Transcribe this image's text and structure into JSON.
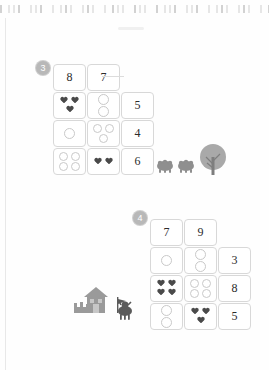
{
  "page": {
    "type": "math-worksheet-scan",
    "background": "#fefefe",
    "ink_color": "#4a4a4a",
    "cell_border_color": "#d8d8d8",
    "badge_color": "#b8b8b8"
  },
  "exercises": [
    {
      "number": "3",
      "header": {
        "left": "8",
        "right": "7"
      },
      "rows": [
        {
          "left": {
            "shape": "heart",
            "count": 3
          },
          "right": {
            "shape": "circle",
            "count": 2
          },
          "answer": "5"
        },
        {
          "left": {
            "shape": "circle",
            "count": 1
          },
          "right": {
            "shape": "circle",
            "count": 3
          },
          "answer": "4"
        },
        {
          "left": {
            "shape": "circle",
            "count": 4
          },
          "right": {
            "shape": "heart",
            "count": 2
          },
          "answer": "6"
        }
      ],
      "illustration": "hedgehogs-and-tree"
    },
    {
      "number": "4",
      "header": {
        "left": "7",
        "right": "9"
      },
      "rows": [
        {
          "left": {
            "shape": "circle",
            "count": 1
          },
          "right": {
            "shape": "circle",
            "count": 2
          },
          "answer": "3"
        },
        {
          "left": {
            "shape": "heart",
            "count": 4
          },
          "right": {
            "shape": "circle",
            "count": 4
          },
          "answer": "8"
        },
        {
          "left": {
            "shape": "circle",
            "count": 2
          },
          "right": {
            "shape": "heart",
            "count": 3
          },
          "answer": "5"
        }
      ],
      "illustration": "castle-and-knight"
    }
  ]
}
